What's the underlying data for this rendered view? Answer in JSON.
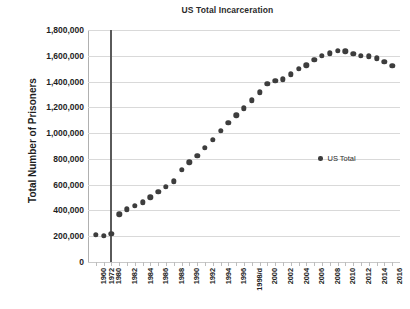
{
  "chart_data": {
    "type": "scatter",
    "title": "US Total Incarceration",
    "xlabel": "",
    "ylabel": "Total Number of Prisoners",
    "ylim": [
      0,
      1800000
    ],
    "grid": true,
    "legend_position": "middle-right",
    "series": [
      {
        "name": "US Total",
        "marker": "circle",
        "color": "#3d3d3d",
        "categories": [
          "1960",
          "1972",
          "1980",
          "1981",
          "1982",
          "1983",
          "1984",
          "1985",
          "1986",
          "1987",
          "1988",
          "1989",
          "1990",
          "1991",
          "1992",
          "1993",
          "1994",
          "1995",
          "1996",
          "1997",
          "1998/d",
          "1999",
          "2000",
          "2001",
          "2002",
          "2003",
          "2004",
          "2005",
          "2006",
          "2007",
          "2008",
          "2009",
          "2010",
          "2011",
          "2012",
          "2013",
          "2014",
          "2015",
          "2016"
        ],
        "values": [
          212000,
          205000,
          220000,
          370000,
          410000,
          437000,
          463000,
          503000,
          545000,
          585000,
          627000,
          713000,
          774000,
          826000,
          884000,
          949000,
          1017000,
          1078000,
          1138000,
          1191000,
          1254000,
          1318000,
          1381000,
          1405000,
          1418000,
          1455000,
          1497000,
          1526000,
          1570000,
          1598000,
          1618000,
          1638000,
          1635000,
          1613000,
          1598000,
          1597000,
          1580000,
          1553000,
          1523000
        ]
      }
    ],
    "y_ticks": [
      "1,800,000",
      "1,600,000",
      "1,400,000",
      "1,200,000",
      "1,000,000",
      "800,000",
      "600,000",
      "400,000",
      "200,000",
      "0"
    ],
    "y_tick_values": [
      1800000,
      1600000,
      1400000,
      1200000,
      1000000,
      800000,
      600000,
      400000,
      200000,
      0
    ],
    "x_tick_labels": [
      "1960",
      "1972",
      "1980",
      "1982",
      "1984",
      "1986",
      "1988",
      "1990",
      "1992",
      "1994",
      "1996",
      "1998/d",
      "2000",
      "2002",
      "2004",
      "2006",
      "2008",
      "2010",
      "2012",
      "2014",
      "2016"
    ],
    "annotations": [
      {
        "name": "reference-line",
        "type": "vline",
        "category": "1980",
        "color": "#5a5a5a"
      }
    ]
  },
  "legend": {
    "entries": [
      {
        "label": "US Total",
        "marker_icon": "circle-marker-icon"
      }
    ]
  },
  "colors": {
    "marker": "#3d3d3d",
    "gridline": "#d9d9d9",
    "axis": "#b0b0b0",
    "reference_line": "#5a5a5a",
    "text": "#1e1e1e",
    "background": "#ffffff"
  }
}
